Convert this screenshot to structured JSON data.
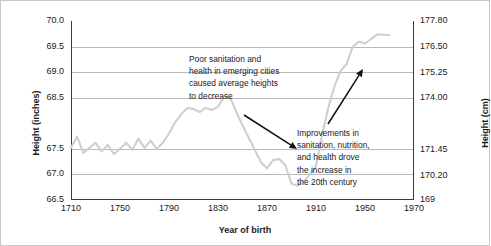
{
  "chart_data": {
    "type": "line",
    "title": "",
    "xlabel": "Year of birth",
    "ylabel": "Height (inches)",
    "ylabel_secondary": "Height (cm)",
    "grid": true,
    "legend": "none",
    "xlim": [
      1710,
      1970
    ],
    "ylim": [
      66.5,
      70.0
    ],
    "ylim_secondary": [
      169,
      177.8
    ],
    "xticks": [
      "1710",
      "1750",
      "1790",
      "1830",
      "1870",
      "1910",
      "1950",
      "1970"
    ],
    "xtick_values": [
      1710,
      1750,
      1790,
      1830,
      1870,
      1910,
      1950,
      1970
    ],
    "yticks_left": [
      "70.0",
      "69.5",
      "69.0",
      "68.5",
      "67.5",
      "67.0",
      "66.5"
    ],
    "ytick_values_left": [
      70.0,
      69.5,
      69.0,
      68.5,
      67.5,
      67.0,
      66.5
    ],
    "yticks_right": [
      "177.80",
      "176.50",
      "175.25",
      "174.00",
      "171.45",
      "170.20",
      "169"
    ],
    "ytick_values_right": [
      177.8,
      176.5,
      175.25,
      174.0,
      171.45,
      170.2,
      169.0
    ],
    "series": [
      {
        "name": "Average height by year of birth",
        "color": "#cfcfcf",
        "x": [
          1710,
          1715,
          1720,
          1725,
          1730,
          1735,
          1740,
          1745,
          1750,
          1755,
          1760,
          1765,
          1770,
          1775,
          1780,
          1785,
          1790,
          1795,
          1800,
          1805,
          1810,
          1815,
          1820,
          1825,
          1830,
          1835,
          1840,
          1845,
          1850,
          1855,
          1860,
          1865,
          1870,
          1875,
          1880,
          1885,
          1890,
          1895,
          1900,
          1905,
          1910,
          1915,
          1920,
          1925,
          1930,
          1935,
          1940,
          1945,
          1950,
          1955,
          1960
        ],
        "values": [
          67.52,
          67.74,
          67.42,
          67.52,
          67.62,
          67.45,
          67.58,
          67.4,
          67.5,
          67.62,
          67.48,
          67.7,
          67.52,
          67.66,
          67.5,
          67.62,
          67.8,
          68.02,
          68.18,
          68.3,
          68.28,
          68.22,
          68.3,
          68.26,
          68.32,
          68.52,
          68.5,
          68.22,
          67.96,
          67.72,
          67.48,
          67.24,
          67.12,
          67.28,
          67.3,
          67.18,
          66.82,
          66.78,
          66.86,
          67.0,
          67.16,
          67.78,
          68.3,
          68.72,
          69.02,
          69.16,
          69.5,
          69.6,
          69.56,
          69.74,
          69.72
        ]
      }
    ],
    "annotations": [
      {
        "id": "annotation-1",
        "text": "Poor sanitation and\nhealth in emerging cities\ncaused average heights\nto decrease",
        "arrow_from": [
          243,
          114
        ],
        "arrow_to": [
          296,
          148
        ]
      },
      {
        "id": "annotation-2",
        "text": "Improvements in\nsanitation, nutrition,\nand health drove\nthe increase in\nthe 20th century",
        "arrow_from": [
          327,
          123
        ],
        "arrow_to": [
          362,
          68
        ]
      }
    ]
  },
  "colors": {
    "line": "#cfcfcf",
    "grid": "#b9b9b9",
    "axis": "#3a3a3a",
    "text": "#1a1a1a",
    "arrow": "#111111",
    "background": "#ffffff",
    "border": "#c8c8c8"
  }
}
